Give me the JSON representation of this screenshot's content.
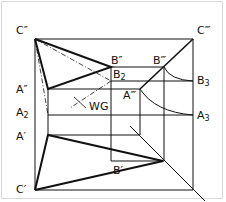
{
  "diagram": {
    "type": "descriptive-geometry-projection",
    "labels": {
      "c_double_prime": "C″",
      "c_triple_prime": "C‴",
      "b_double_prime": "B″",
      "b_triple_prime": "B‴",
      "b2_base": "B",
      "b2_sub": "2",
      "b3_base": "B",
      "b3_sub": "3",
      "a_double_prime": "A″",
      "a_triple_prime": "A‴",
      "a2_base": "A",
      "a2_sub": "2",
      "a3_base": "A",
      "a3_sub": "3",
      "a_prime": "A′",
      "b_prime": "B′",
      "c_prime": "C′",
      "wg": "WG"
    },
    "colors": {
      "line": "#111111",
      "background": "#ffffff",
      "border": "#d8d8d8"
    }
  }
}
